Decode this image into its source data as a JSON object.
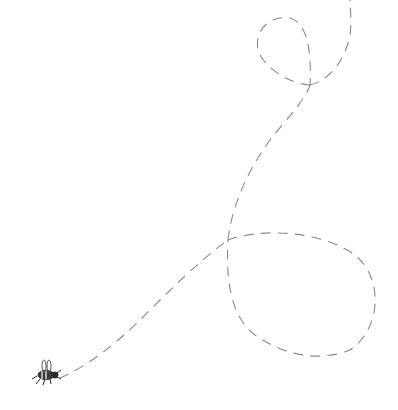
{
  "illustration": {
    "subject": "bee-with-dashed-flight-path",
    "background": "#ffffff",
    "stroke_color": "#8a8a8a",
    "bee_color": "#2a2a2a"
  }
}
